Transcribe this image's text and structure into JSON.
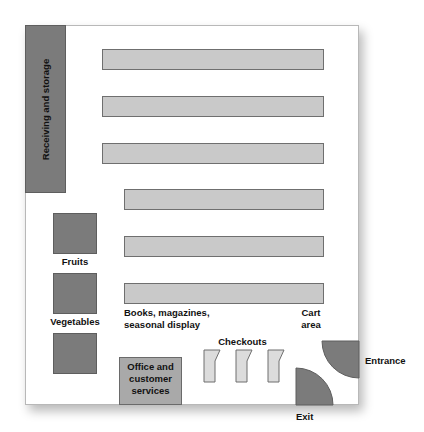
{
  "diagram": {
    "type": "store-floor-plan",
    "zones": {
      "receiving": "Receiving and storage",
      "fruits": "Fruits",
      "vegetables": "Vegetables",
      "books": "Books, magazines,",
      "books_line2": "seasonal display",
      "cart_area": "Cart",
      "cart_area_line2": "area",
      "checkouts": "Checkouts",
      "office": "Office and",
      "office_line2": "customer",
      "office_line3": "services",
      "entrance": "Entrance",
      "exit": "Exit"
    },
    "aisles_count": 6,
    "checkout_count": 3,
    "produce_bins_count": 3,
    "colors": {
      "dark_block": "#7b7b7b",
      "aisle": "#c9c9c9",
      "office": "#a9a9a9",
      "checkout": "#dcdcdc",
      "door": "#7b7b7b"
    }
  }
}
